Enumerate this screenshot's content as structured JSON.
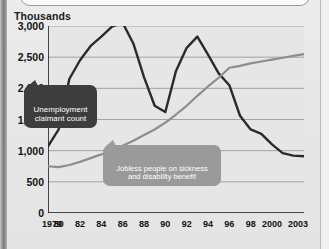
{
  "axis_caption": "Thousands",
  "callouts": {
    "series1": "Unemployment\nclaimant count",
    "series2": "Jobless people on sickness\nand disability benefit"
  },
  "colors": {
    "series1": "#2b2b2b",
    "series2": "#8d8d8d",
    "background": "#e8e8e8",
    "gridline": "#9b9b9b",
    "axis": "#1b1b1b"
  },
  "chart_data": {
    "type": "line",
    "title": "",
    "subtitle": "",
    "xlabel": "",
    "ylabel": "Thousands",
    "ylim": [
      0,
      3000
    ],
    "ytick_labels": [
      "3,000",
      "2,500",
      "2,000",
      "1,500",
      "1,000",
      "500",
      "0"
    ],
    "ytick_values": [
      3000,
      2500,
      2000,
      1500,
      1000,
      500,
      0
    ],
    "xlim": [
      1979,
      2003
    ],
    "xtick_labels": [
      "1979",
      "80",
      "82",
      "84",
      "86",
      "88",
      "90",
      "92",
      "94",
      "96",
      "98",
      "2000",
      "2003"
    ],
    "xtick_values": [
      1979,
      1980,
      1982,
      1984,
      1986,
      1988,
      1990,
      1992,
      1994,
      1996,
      1998,
      2000,
      2003
    ],
    "minor_ticks_every": 1,
    "grid": true,
    "grid_axis": "y",
    "legend": "annotations",
    "x": [
      1979,
      1980,
      1981,
      1982,
      1983,
      1984,
      1985,
      1986,
      1987,
      1988,
      1989,
      1990,
      1991,
      1992,
      1993,
      1994,
      1995,
      1996,
      1997,
      1998,
      1999,
      2000,
      2001,
      2002,
      2003
    ],
    "series": [
      {
        "name": "Unemployment claimant count",
        "color": "#2b2b2b",
        "values": [
          1070,
          1340,
          2150,
          2450,
          2680,
          2830,
          2990,
          3050,
          2720,
          2180,
          1720,
          1620,
          2280,
          2650,
          2830,
          2540,
          2240,
          2050,
          1560,
          1340,
          1270,
          1100,
          960,
          920,
          910
        ]
      },
      {
        "name": "Jobless people on sickness and disability benefit",
        "color": "#8d8d8d",
        "values": [
          750,
          735,
          770,
          820,
          880,
          940,
          1010,
          1080,
          1160,
          1250,
          1340,
          1450,
          1580,
          1720,
          1880,
          2030,
          2170,
          2330,
          2360,
          2400,
          2430,
          2460,
          2490,
          2520,
          2550
        ]
      }
    ]
  }
}
